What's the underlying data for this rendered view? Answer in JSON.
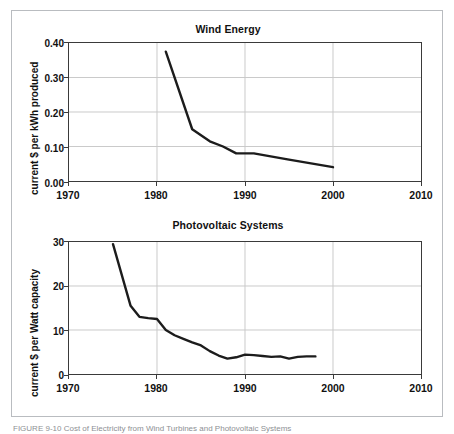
{
  "figure": {
    "caption": "FIGURE 9-10  Cost of Electricity from Wind Turbines and Photovoltaic Systems"
  },
  "chart_data": [
    {
      "type": "line",
      "title": "Wind Energy",
      "xlabel": "",
      "ylabel": "current $ per kWh produced",
      "xlim": [
        1970,
        2010
      ],
      "ylim": [
        0.0,
        0.4
      ],
      "grid": true,
      "legend": "none",
      "xticks": [
        "1970",
        "1980",
        "1990",
        "2000",
        "2010"
      ],
      "xtick_values": [
        1970,
        1980,
        1990,
        2000,
        2010
      ],
      "yticks": [
        "0.00",
        "0.10",
        "0.20",
        "0.30",
        "0.40"
      ],
      "ytick_values": [
        0.0,
        0.1,
        0.2,
        0.3,
        0.4
      ],
      "series": [
        {
          "name": "Wind energy cost",
          "x": [
            1981,
            1984,
            1986,
            1987.5,
            1989,
            1991,
            1995,
            2000
          ],
          "values": [
            0.375,
            0.15,
            0.115,
            0.1,
            0.08,
            0.08,
            0.062,
            0.04
          ]
        }
      ]
    },
    {
      "type": "line",
      "title": "Photovoltaic Systems",
      "xlabel": "",
      "ylabel": "current $ per Watt capacity",
      "xlim": [
        1970,
        2010
      ],
      "ylim": [
        0,
        30
      ],
      "grid": true,
      "legend": "none",
      "xticks": [
        "1970",
        "1980",
        "1990",
        "2000",
        "2010"
      ],
      "xtick_values": [
        1970,
        1980,
        1990,
        2000,
        2010
      ],
      "yticks": [
        "0",
        "10",
        "20",
        "30"
      ],
      "ytick_values": [
        0,
        10,
        20,
        30
      ],
      "series": [
        {
          "name": "Photovoltaic system cost",
          "x": [
            1975,
            1977,
            1978,
            1979,
            1980,
            1981,
            1982,
            1983,
            1984,
            1985,
            1986,
            1987,
            1988,
            1989,
            1990,
            1991,
            1992,
            1993,
            1994,
            1995,
            1996,
            1997,
            1998
          ],
          "values": [
            29.5,
            15.5,
            13.0,
            12.7,
            12.5,
            10.0,
            8.8,
            8.0,
            7.2,
            6.5,
            5.2,
            4.2,
            3.5,
            3.8,
            4.4,
            4.3,
            4.1,
            3.9,
            4.0,
            3.5,
            3.9,
            4.0,
            4.0
          ]
        }
      ]
    }
  ]
}
